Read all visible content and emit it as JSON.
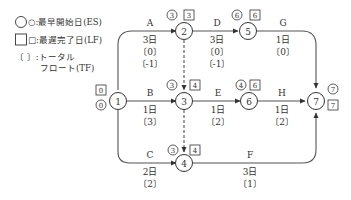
{
  "legend": {
    "circle_label": "○:最早開始日(ES)",
    "square_label": "□:最遅完了日(LF)",
    "bracket_label_line1": "〔 〕:トータル",
    "bracket_label_line2": "フロート(TF)"
  },
  "nodes": [
    {
      "id": "1",
      "es": "0",
      "lf": "0"
    },
    {
      "id": "2",
      "es": "3",
      "lf": "3"
    },
    {
      "id": "3",
      "es": "3",
      "lf": "4"
    },
    {
      "id": "4",
      "es": "3",
      "lf": "4"
    },
    {
      "id": "5",
      "es": "6",
      "lf": "6"
    },
    {
      "id": "6",
      "es": "4",
      "lf": "6"
    },
    {
      "id": "7",
      "es": "7",
      "lf": "7"
    }
  ],
  "activities": [
    {
      "name": "A",
      "from": "1",
      "to": "2",
      "duration": "3日",
      "tf": "〔0〕",
      "extra": "〔-1〕"
    },
    {
      "name": "B",
      "from": "1",
      "to": "3",
      "duration": "1日",
      "tf": "〔3〕"
    },
    {
      "name": "C",
      "from": "1",
      "to": "4",
      "duration": "2日",
      "tf": "〔2〕"
    },
    {
      "name": "D",
      "from": "2",
      "to": "5",
      "duration": "3日",
      "tf": "〔0〕",
      "extra": "〔-1〕"
    },
    {
      "name": "E",
      "from": "3",
      "to": "6",
      "duration": "1日",
      "tf": "〔2〕"
    },
    {
      "name": "F",
      "from": "4",
      "to": "7",
      "duration": "3日",
      "tf": "〔1〕"
    },
    {
      "name": "G",
      "from": "5",
      "to": "7",
      "duration": "1日",
      "tf": "〔0〕"
    },
    {
      "name": "H",
      "from": "6",
      "to": "7",
      "duration": "1日",
      "tf": "〔2〕"
    }
  ],
  "dummies": [
    {
      "from": "2",
      "to": "3"
    },
    {
      "from": "3",
      "to": "4"
    }
  ]
}
